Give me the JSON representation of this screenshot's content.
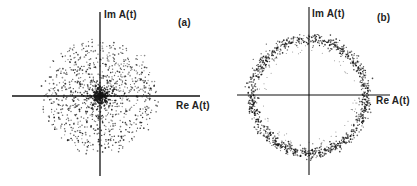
{
  "chart_data": [
    {
      "type": "scatter",
      "panel_label": "(a)",
      "xlabel": "Re A(t)",
      "ylabel": "Im A(t)",
      "description": "Random complex amplitudes: 2D Gaussian-like cloud of points centered at origin with dense core",
      "center": [
        0,
        0
      ],
      "cloud_radius_px": 58,
      "core_radius_px": 8,
      "grid": false,
      "axes": "crosshair through origin",
      "n_points_approx": 900
    },
    {
      "type": "scatter",
      "panel_label": "(b)",
      "xlabel": "Re A(t)",
      "ylabel": "Im A(t)",
      "description": "Complex amplitudes lying on a ring of nearly constant modulus centered at origin",
      "center": [
        0,
        0
      ],
      "ring_radius_px": 57,
      "ring_width_px": 6,
      "grid": false,
      "axes": "crosshair through origin",
      "n_points_approx": 1100
    }
  ],
  "panels": {
    "a": {
      "label": "(a)",
      "y_axis_label": "Im A(t)",
      "x_axis_label": "Re A(t)"
    },
    "b": {
      "label": "(b)",
      "y_axis_label": "Im A(t)",
      "x_axis_label": "Re A(t)"
    }
  },
  "colors": {
    "ink": "#1a1a1a",
    "background": "#ffffff"
  }
}
